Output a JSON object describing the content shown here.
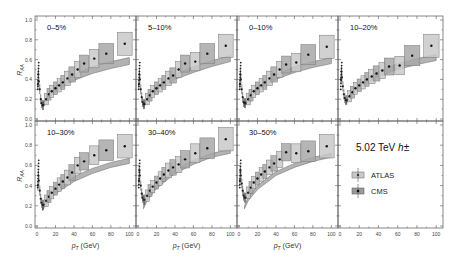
{
  "chart_data": {
    "type": "scatter",
    "title": "",
    "xlabel": "p_T (GeV)",
    "ylabel": "R_AA",
    "xlim": [
      0,
      105
    ],
    "ylim": [
      0,
      1.0
    ],
    "x_ticks": [
      "0",
      "20",
      "40",
      "60",
      "80",
      "100"
    ],
    "y_ticks": [
      "0.0",
      "0.2",
      "0.4",
      "0.6",
      "0.8",
      "1.0"
    ],
    "grid": false,
    "legend": {
      "title": "5.02 TeV h±",
      "entries": [
        {
          "label": "ATLAS",
          "marker": "light-box-dot",
          "color": "#bdbdbd"
        },
        {
          "label": "CMS",
          "marker": "dark-box-dot",
          "color": "#8f8f8f"
        }
      ]
    },
    "panels": [
      {
        "label": "0–5%",
        "band_low": [
          [
            6,
            0.12
          ],
          [
            10,
            0.19
          ],
          [
            20,
            0.28
          ],
          [
            40,
            0.39
          ],
          [
            60,
            0.46
          ],
          [
            80,
            0.51
          ],
          [
            100,
            0.55
          ]
        ],
        "band_high": [
          [
            6,
            0.15
          ],
          [
            10,
            0.22
          ],
          [
            20,
            0.33
          ],
          [
            40,
            0.45
          ],
          [
            60,
            0.53
          ],
          [
            80,
            0.58
          ],
          [
            100,
            0.62
          ]
        ],
        "lowpt": [
          [
            1,
            0.35
          ],
          [
            1.5,
            0.45
          ],
          [
            2,
            0.38
          ],
          [
            3,
            0.3
          ],
          [
            4,
            0.2
          ],
          [
            5,
            0.16
          ],
          [
            6,
            0.14
          ],
          [
            7,
            0.14
          ]
        ],
        "points": [
          [
            10,
            0.2
          ],
          [
            13,
            0.25
          ],
          [
            16,
            0.28
          ],
          [
            20,
            0.31
          ],
          [
            24,
            0.34
          ],
          [
            28,
            0.37
          ],
          [
            33,
            0.41
          ],
          [
            38,
            0.45
          ],
          [
            44,
            0.5
          ],
          [
            51,
            0.56
          ],
          [
            62,
            0.61
          ],
          [
            75,
            0.66
          ],
          [
            95,
            0.76
          ]
        ]
      },
      {
        "label": "5–10%",
        "band_low": [
          [
            6,
            0.12
          ],
          [
            10,
            0.19
          ],
          [
            20,
            0.29
          ],
          [
            40,
            0.4
          ],
          [
            60,
            0.47
          ],
          [
            80,
            0.53
          ],
          [
            100,
            0.58
          ]
        ],
        "band_high": [
          [
            6,
            0.15
          ],
          [
            10,
            0.22
          ],
          [
            20,
            0.33
          ],
          [
            40,
            0.45
          ],
          [
            60,
            0.53
          ],
          [
            80,
            0.59
          ],
          [
            100,
            0.64
          ]
        ],
        "lowpt": [
          [
            1,
            0.35
          ],
          [
            1.5,
            0.45
          ],
          [
            2,
            0.4
          ],
          [
            3,
            0.3
          ],
          [
            4,
            0.22
          ],
          [
            5,
            0.17
          ],
          [
            6,
            0.15
          ],
          [
            7,
            0.15
          ]
        ],
        "points": [
          [
            10,
            0.2
          ],
          [
            13,
            0.24
          ],
          [
            16,
            0.28
          ],
          [
            20,
            0.31
          ],
          [
            24,
            0.34
          ],
          [
            28,
            0.37
          ],
          [
            33,
            0.41
          ],
          [
            38,
            0.44
          ],
          [
            44,
            0.5
          ],
          [
            51,
            0.56
          ],
          [
            62,
            0.58
          ],
          [
            75,
            0.66
          ],
          [
            95,
            0.74
          ]
        ]
      },
      {
        "label": "0–10%",
        "band_low": [
          [
            6,
            0.13
          ],
          [
            10,
            0.19
          ],
          [
            20,
            0.29
          ],
          [
            40,
            0.4
          ],
          [
            60,
            0.47
          ],
          [
            80,
            0.52
          ],
          [
            100,
            0.56
          ]
        ],
        "band_high": [
          [
            6,
            0.16
          ],
          [
            10,
            0.22
          ],
          [
            20,
            0.33
          ],
          [
            40,
            0.45
          ],
          [
            60,
            0.53
          ],
          [
            80,
            0.58
          ],
          [
            100,
            0.62
          ]
        ],
        "lowpt": [
          [
            1,
            0.35
          ],
          [
            1.5,
            0.45
          ],
          [
            2,
            0.4
          ],
          [
            3,
            0.3
          ],
          [
            4,
            0.22
          ],
          [
            5,
            0.17
          ],
          [
            6,
            0.16
          ],
          [
            7,
            0.16
          ]
        ],
        "points": [
          [
            10,
            0.2
          ],
          [
            13,
            0.24
          ],
          [
            16,
            0.28
          ],
          [
            20,
            0.31
          ],
          [
            24,
            0.34
          ],
          [
            28,
            0.37
          ],
          [
            33,
            0.41
          ],
          [
            38,
            0.45
          ],
          [
            44,
            0.5
          ],
          [
            51,
            0.55
          ],
          [
            62,
            0.57
          ],
          [
            75,
            0.65
          ],
          [
            95,
            0.73
          ]
        ]
      },
      {
        "label": "10–20%",
        "band_low": [
          [
            6,
            0.15
          ],
          [
            10,
            0.22
          ],
          [
            20,
            0.32
          ],
          [
            40,
            0.43
          ],
          [
            60,
            0.5
          ],
          [
            80,
            0.55
          ],
          [
            100,
            0.59
          ]
        ],
        "band_high": [
          [
            6,
            0.18
          ],
          [
            10,
            0.25
          ],
          [
            20,
            0.36
          ],
          [
            40,
            0.48
          ],
          [
            60,
            0.56
          ],
          [
            80,
            0.61
          ],
          [
            100,
            0.65
          ]
        ],
        "lowpt": [
          [
            1,
            0.4
          ],
          [
            1.5,
            0.48
          ],
          [
            2,
            0.42
          ],
          [
            3,
            0.33
          ],
          [
            4,
            0.25
          ],
          [
            5,
            0.21
          ],
          [
            6,
            0.19
          ],
          [
            7,
            0.19
          ]
        ],
        "points": [
          [
            10,
            0.23
          ],
          [
            13,
            0.27
          ],
          [
            16,
            0.31
          ],
          [
            20,
            0.34
          ],
          [
            24,
            0.37
          ],
          [
            28,
            0.4
          ],
          [
            33,
            0.43
          ],
          [
            38,
            0.46
          ],
          [
            44,
            0.49
          ],
          [
            51,
            0.53
          ],
          [
            62,
            0.54
          ],
          [
            75,
            0.64
          ],
          [
            95,
            0.74
          ]
        ]
      },
      {
        "label": "10–30%",
        "band_low": [
          [
            6,
            0.15
          ],
          [
            10,
            0.22
          ],
          [
            20,
            0.32
          ],
          [
            40,
            0.44
          ],
          [
            60,
            0.52
          ],
          [
            80,
            0.58
          ],
          [
            100,
            0.62
          ]
        ],
        "band_high": [
          [
            6,
            0.18
          ],
          [
            10,
            0.25
          ],
          [
            20,
            0.36
          ],
          [
            40,
            0.49
          ],
          [
            60,
            0.57
          ],
          [
            80,
            0.63
          ],
          [
            100,
            0.67
          ]
        ],
        "lowpt": [
          [
            1,
            0.4
          ],
          [
            1.5,
            0.5
          ],
          [
            2,
            0.45
          ],
          [
            3,
            0.35
          ],
          [
            4,
            0.27
          ],
          [
            5,
            0.23
          ],
          [
            6,
            0.21
          ],
          [
            7,
            0.21
          ]
        ],
        "points": [
          [
            10,
            0.25
          ],
          [
            13,
            0.29
          ],
          [
            16,
            0.33
          ],
          [
            20,
            0.37
          ],
          [
            24,
            0.41
          ],
          [
            28,
            0.44
          ],
          [
            33,
            0.48
          ],
          [
            38,
            0.53
          ],
          [
            44,
            0.6
          ],
          [
            51,
            0.64
          ],
          [
            62,
            0.7
          ],
          [
            75,
            0.75
          ],
          [
            95,
            0.79
          ]
        ]
      },
      {
        "label": "30–40%",
        "band_low": [
          [
            6,
            0.17
          ],
          [
            10,
            0.25
          ],
          [
            20,
            0.37
          ],
          [
            40,
            0.52
          ],
          [
            60,
            0.61
          ],
          [
            80,
            0.68
          ],
          [
            100,
            0.72
          ]
        ],
        "band_high": [
          [
            6,
            0.2
          ],
          [
            10,
            0.29
          ],
          [
            20,
            0.41
          ],
          [
            40,
            0.56
          ],
          [
            60,
            0.65
          ],
          [
            80,
            0.72
          ],
          [
            100,
            0.76
          ]
        ],
        "lowpt": [
          [
            1,
            0.45
          ],
          [
            1.5,
            0.55
          ],
          [
            2,
            0.5
          ],
          [
            3,
            0.4
          ],
          [
            4,
            0.32
          ],
          [
            5,
            0.28
          ],
          [
            6,
            0.26
          ],
          [
            7,
            0.26
          ]
        ],
        "points": [
          [
            10,
            0.3
          ],
          [
            13,
            0.35
          ],
          [
            16,
            0.39
          ],
          [
            20,
            0.43
          ],
          [
            24,
            0.47
          ],
          [
            28,
            0.51
          ],
          [
            33,
            0.55
          ],
          [
            38,
            0.58
          ],
          [
            44,
            0.61
          ],
          [
            51,
            0.66
          ],
          [
            62,
            0.72
          ],
          [
            75,
            0.77
          ],
          [
            95,
            0.86
          ]
        ]
      },
      {
        "label": "30–50%",
        "band_low": [
          [
            6,
            0.17
          ],
          [
            10,
            0.25
          ],
          [
            20,
            0.36
          ],
          [
            40,
            0.5
          ],
          [
            60,
            0.58
          ],
          [
            80,
            0.64
          ],
          [
            100,
            0.68
          ]
        ],
        "band_high": [
          [
            6,
            0.2
          ],
          [
            10,
            0.29
          ],
          [
            20,
            0.4
          ],
          [
            40,
            0.54
          ],
          [
            60,
            0.62
          ],
          [
            80,
            0.68
          ],
          [
            100,
            0.72
          ]
        ],
        "lowpt": [
          [
            1,
            0.45
          ],
          [
            1.5,
            0.55
          ],
          [
            2,
            0.5
          ],
          [
            3,
            0.42
          ],
          [
            4,
            0.35
          ],
          [
            5,
            0.3
          ],
          [
            6,
            0.28
          ],
          [
            7,
            0.28
          ]
        ],
        "points": [
          [
            10,
            0.33
          ],
          [
            13,
            0.38
          ],
          [
            16,
            0.43
          ],
          [
            20,
            0.47
          ],
          [
            24,
            0.51
          ],
          [
            28,
            0.54
          ],
          [
            33,
            0.58
          ],
          [
            38,
            0.62
          ],
          [
            44,
            0.66
          ],
          [
            51,
            0.73
          ],
          [
            62,
            0.72
          ],
          [
            75,
            0.74
          ],
          [
            95,
            0.79
          ]
        ]
      }
    ]
  },
  "legend_panel": {
    "energy_label": "5.02 TeV",
    "particle_label": "h±",
    "atlas_label": "ATLAS",
    "cms_label": "CMS"
  },
  "axes": {
    "xlabel_main": "p",
    "xlabel_sub": "T",
    "xlabel_unit": " (GeV)",
    "ylabel_main": "R",
    "ylabel_sub": "AA"
  }
}
